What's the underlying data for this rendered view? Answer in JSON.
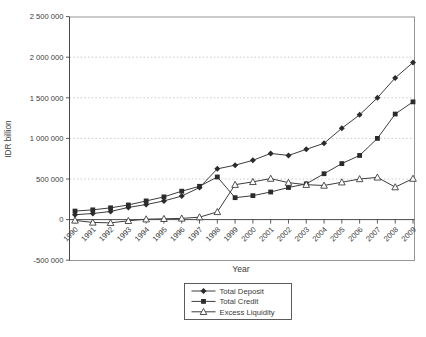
{
  "figure": {
    "background": "#ffffff"
  },
  "chart_data": {
    "type": "line",
    "title": "",
    "xlabel": "Year",
    "ylabel": "IDR billion",
    "x": [
      "1990",
      "1991",
      "1992",
      "1993",
      "1994",
      "1995",
      "1996",
      "1997",
      "1998",
      "1999",
      "2000",
      "2001",
      "2002",
      "2003",
      "2004",
      "2005",
      "2006",
      "2007",
      "2008",
      "2009"
    ],
    "series": [
      {
        "name": "Total Deposit",
        "marker": "diamond-filled",
        "values": [
          60000,
          75000,
          100000,
          150000,
          185000,
          230000,
          290000,
          395000,
          625000,
          670000,
          730000,
          815000,
          790000,
          865000,
          940000,
          1125000,
          1290000,
          1500000,
          1745000,
          1935000
        ]
      },
      {
        "name": "Total Credit",
        "marker": "square-filled",
        "values": [
          105000,
          120000,
          145000,
          180000,
          230000,
          280000,
          350000,
          410000,
          525000,
          270000,
          295000,
          340000,
          395000,
          440000,
          565000,
          690000,
          790000,
          1000000,
          1300000,
          1450000
        ]
      },
      {
        "name": "Excess Liquidity",
        "marker": "triangle-open",
        "values": [
          -10000,
          -35000,
          -40000,
          -15000,
          5000,
          10000,
          15000,
          30000,
          95000,
          430000,
          465000,
          505000,
          455000,
          430000,
          420000,
          460000,
          500000,
          520000,
          400000,
          505000
        ]
      }
    ],
    "ylim": [
      -500000,
      2500000
    ],
    "yticks": [
      {
        "value": 2500000,
        "label": "2 500 000"
      },
      {
        "value": 2000000,
        "label": "2 000 000"
      },
      {
        "value": 1500000,
        "label": "1 500 000"
      },
      {
        "value": 1000000,
        "label": "1 000 000"
      },
      {
        "value": 500000,
        "label": "500 000"
      },
      {
        "value": 0,
        "label": "0"
      },
      {
        "value": -500000,
        "label": "-500 000"
      }
    ],
    "grid_values": [
      2000000,
      1500000,
      1000000,
      500000
    ],
    "grid": "horizontal-dotted",
    "legend_position": "bottom-center",
    "colors": {
      "line": "#3d3d3d",
      "marker_fill": "#2b2b2b",
      "marker_open_fill": "#ffffff",
      "grid": "#bdbdbd",
      "frame": "#8a8a8a",
      "axis": "#4a4a4a",
      "text": "#3a3a3a",
      "background": "#ffffff"
    }
  }
}
